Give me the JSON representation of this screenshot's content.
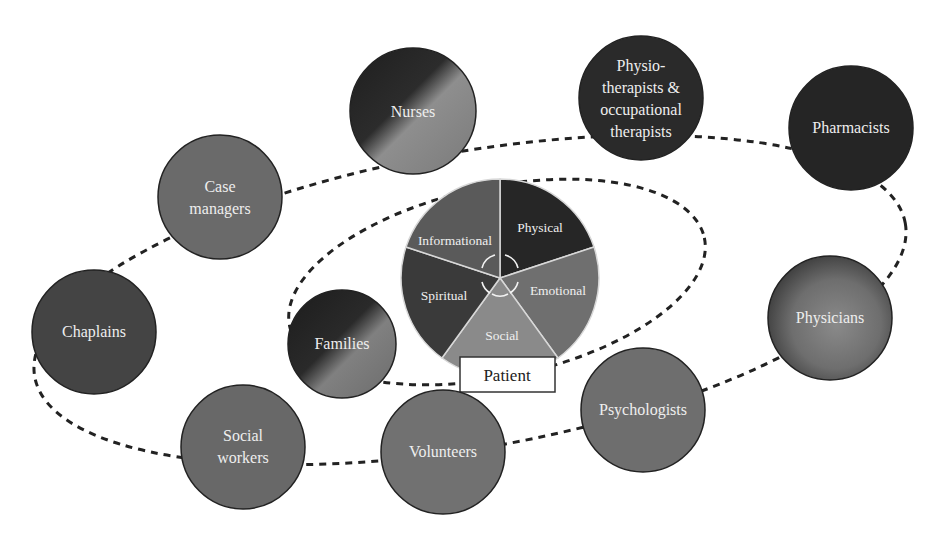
{
  "diagram": {
    "center": {
      "patient_label": "Patient",
      "segments": [
        {
          "label": "Physical",
          "color": "#262626"
        },
        {
          "label": "Emotional",
          "color": "#6f6f6f"
        },
        {
          "label": "Social",
          "color": "#8a8a8a"
        },
        {
          "label": "Spiritual",
          "color": "#3a3a3a"
        },
        {
          "label": "Informational",
          "color": "#5a5a5a"
        }
      ]
    },
    "nodes": [
      {
        "id": "nurses",
        "lines": [
          "Nurses"
        ]
      },
      {
        "id": "physio",
        "lines": [
          "Physio-",
          "therapists &",
          "occupational",
          "therapists"
        ]
      },
      {
        "id": "pharmacists",
        "lines": [
          "Pharmacists"
        ]
      },
      {
        "id": "case-managers",
        "lines": [
          "Case",
          "managers"
        ]
      },
      {
        "id": "chaplains",
        "lines": [
          "Chaplains"
        ]
      },
      {
        "id": "families",
        "lines": [
          "Families"
        ]
      },
      {
        "id": "physicians",
        "lines": [
          "Physicians"
        ]
      },
      {
        "id": "psychologists",
        "lines": [
          "Psychologists"
        ]
      },
      {
        "id": "social-workers",
        "lines": [
          "Social",
          "workers"
        ]
      },
      {
        "id": "volunteers",
        "lines": [
          "Volunteers"
        ]
      }
    ]
  }
}
